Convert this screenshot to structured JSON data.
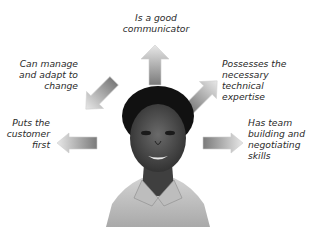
{
  "diagram": {
    "type": "radial-attributes",
    "center": "photo-of-professional-woman",
    "attributes": [
      {
        "id": "communicator",
        "label_lines": [
          "Is a good",
          "communicator"
        ],
        "direction": "up"
      },
      {
        "id": "manage-adapt",
        "label_lines": [
          "Can manage",
          "and adapt to",
          "change"
        ],
        "direction": "up-left"
      },
      {
        "id": "technical",
        "label_lines": [
          "Possesses the",
          "necessary technical",
          "expertise"
        ],
        "direction": "up-right"
      },
      {
        "id": "customer",
        "label_lines": [
          "Puts the",
          "customer",
          "first"
        ],
        "direction": "left"
      },
      {
        "id": "team",
        "label_lines": [
          "Has team",
          "building and",
          "negotiating",
          "skills"
        ],
        "direction": "right"
      }
    ],
    "colors": {
      "arrow_dark": "#7a7a7a",
      "arrow_light": "#e6e6e6",
      "text": "#2a2a2a",
      "background": "#ffffff"
    }
  }
}
